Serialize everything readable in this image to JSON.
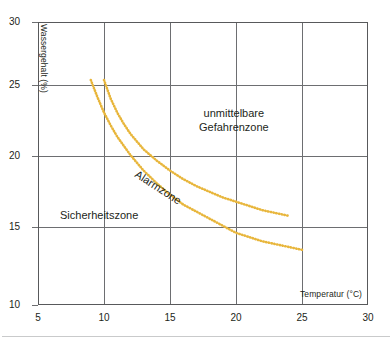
{
  "chart_data": {
    "type": "line",
    "title": "",
    "subtitle": "",
    "xlabel": "Temperatur (°C)",
    "ylabel": "Wassergehalt (%)",
    "xlim": [
      5,
      30
    ],
    "ylim": [
      10,
      30
    ],
    "xticks": [
      "5",
      "10",
      "15",
      "20",
      "25",
      "30"
    ],
    "yticks": [
      "30",
      "25",
      "20",
      "15",
      "10"
    ],
    "grid": true,
    "legend_position": "none",
    "curve_color": "#e8b63c",
    "line_style": "dotted",
    "series": [
      {
        "name": "Obere Grenzkurve (Alarmzone / unmittelbare Gefahrenzone)",
        "x": [
          10.0,
          10.5,
          11.0,
          11.5,
          12.0,
          13.0,
          14.0,
          15.0,
          16.0,
          17.0,
          18.0,
          19.0,
          20.0,
          21.0,
          22.0,
          23.0,
          24.0
        ],
        "values": [
          25.9,
          24.6,
          23.6,
          22.8,
          22.1,
          21.0,
          20.2,
          19.5,
          18.9,
          18.4,
          18.0,
          17.6,
          17.3,
          17.0,
          16.7,
          16.5,
          16.3
        ]
      },
      {
        "name": "Untere Grenzkurve (Sicherheitszone / Alarmzone)",
        "x": [
          9.0,
          9.5,
          10.0,
          10.5,
          11.0,
          12.0,
          13.0,
          14.0,
          15.0,
          16.0,
          17.0,
          18.0,
          19.0,
          20.0,
          21.0,
          22.0,
          23.0,
          24.0,
          25.0
        ],
        "values": [
          25.9,
          24.7,
          23.6,
          22.7,
          21.9,
          20.6,
          19.5,
          18.6,
          17.8,
          17.1,
          16.6,
          16.1,
          15.6,
          15.1,
          14.8,
          14.5,
          14.3,
          14.1,
          13.9
        ]
      }
    ],
    "annotations": [
      {
        "id": "danger",
        "text_line1": "unmittelbare",
        "text_line2": "Gefahrenzone",
        "x": 20.0,
        "y": 22.7,
        "rotation": 0
      },
      {
        "id": "alarm",
        "text": "Alarmzone",
        "x": 13.2,
        "y": 18.8,
        "rotation": 33
      },
      {
        "id": "safe",
        "text": "Sicherheitszone",
        "x": 9.5,
        "y": 15.9,
        "rotation": 0
      }
    ]
  },
  "axes": {
    "x_title": "Temperatur (°C)",
    "y_title": "Wassergehalt (%)",
    "x_tick_labels": [
      "5",
      "10",
      "15",
      "20",
      "25",
      "30"
    ],
    "y_tick_labels": [
      "30",
      "25",
      "20",
      "15",
      "10"
    ]
  },
  "zones": {
    "danger_line1": "unmittelbare",
    "danger_line2": "Gefahrenzone",
    "alarm": "Alarmzone",
    "safe": "Sicherheitszone"
  }
}
